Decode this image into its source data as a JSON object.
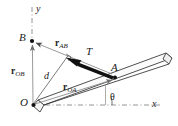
{
  "figure": {
    "kind": "free-body-diagram",
    "background_color": "#ffffff",
    "ink_color": "#1a1a1a",
    "thin_line_color": "#8a8a8a",
    "beam_fill": "#f2f2f2"
  },
  "axes": {
    "y_label": "y",
    "x_label": "x",
    "origin_label": "O",
    "angle_label": "θ"
  },
  "points": [
    {
      "name": "origin",
      "label": "O",
      "x": 33,
      "y": 105
    },
    {
      "name": "point-b",
      "label": "B",
      "x": 32,
      "y": 41
    },
    {
      "name": "point-a",
      "label": "A",
      "x": 115,
      "y": 77
    }
  ],
  "vectors": [
    {
      "name": "r-ob",
      "symbol": "r",
      "subscript": "OB",
      "from": "O",
      "to": "B"
    },
    {
      "name": "r-oa",
      "symbol": "r",
      "subscript": "OA",
      "from": "O",
      "to": "A"
    },
    {
      "name": "r-ab",
      "symbol": "r",
      "subscript": "AB",
      "from": "A",
      "to": "B"
    }
  ],
  "force": {
    "name": "tension",
    "label": "T",
    "applied_at": "A",
    "direction_toward": "B"
  },
  "distance": {
    "name": "moment-arm",
    "label": "d",
    "from": "O",
    "perpendicular_to": "line-AB"
  }
}
